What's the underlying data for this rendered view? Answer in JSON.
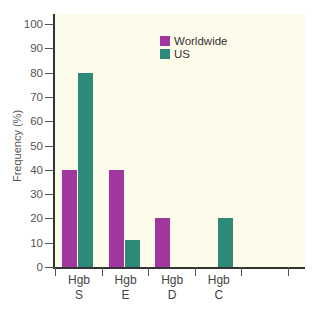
{
  "chart_data": {
    "type": "bar",
    "title": "",
    "xlabel": "",
    "ylabel": "Frequency (%)",
    "ylim": [
      0,
      100
    ],
    "yticks": [
      0,
      10,
      20,
      30,
      40,
      50,
      60,
      70,
      80,
      90,
      100
    ],
    "grid": false,
    "legend_position": "upper-center",
    "categories": [
      "Hgb S",
      "Hgb E",
      "Hgb D",
      "Hgb C",
      ""
    ],
    "category_labels": [
      {
        "line1": "Hgb",
        "line2": "S"
      },
      {
        "line1": "Hgb",
        "line2": "E"
      },
      {
        "line1": "Hgb",
        "line2": "D"
      },
      {
        "line1": "Hgb",
        "line2": "C"
      },
      {
        "line1": "",
        "line2": ""
      }
    ],
    "series": [
      {
        "name": "Worldwide",
        "color": "#a1369e",
        "values": [
          40,
          40,
          20,
          0,
          0
        ]
      },
      {
        "name": "US",
        "color": "#2e8a78",
        "values": [
          80,
          11,
          0,
          20,
          0
        ]
      }
    ]
  },
  "legend": {
    "items": [
      {
        "label": "Worldwide",
        "color": "#a1369e"
      },
      {
        "label": "US",
        "color": "#2e8a78"
      }
    ]
  },
  "colors": {
    "plot_background": "#fdfbea",
    "axis": "#333333"
  }
}
